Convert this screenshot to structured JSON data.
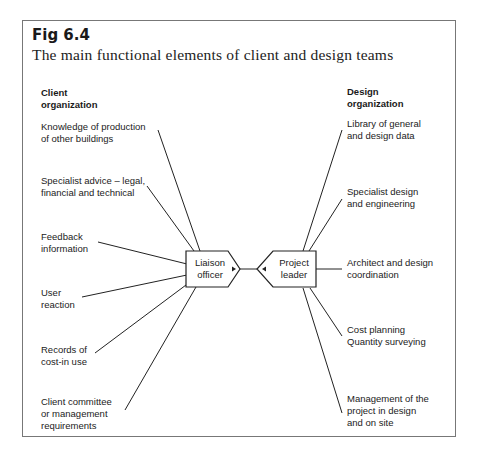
{
  "figure": {
    "label": "Fig 6.4",
    "caption": "The main functional elements of client and design teams"
  },
  "client": {
    "heading_line1": "Client",
    "heading_line2": "organization",
    "hub": {
      "line1": "Liaison",
      "line2": "officer"
    },
    "items": [
      {
        "line1": "Knowledge of production",
        "line2": "of other buildings",
        "line3": ""
      },
      {
        "line1": "Specialist advice – legal,",
        "line2": "financial and technical",
        "line3": ""
      },
      {
        "line1": "Feedback",
        "line2": "information",
        "line3": ""
      },
      {
        "line1": "User",
        "line2": "reaction",
        "line3": ""
      },
      {
        "line1": "Records of",
        "line2": "cost-in use",
        "line3": ""
      },
      {
        "line1": "Client committee",
        "line2": "or management",
        "line3": "requirements"
      }
    ]
  },
  "design": {
    "heading_line1": "Design",
    "heading_line2": "organization",
    "hub": {
      "line1": "Project",
      "line2": "leader"
    },
    "items": [
      {
        "line1": "Library of general",
        "line2": "and design data",
        "line3": ""
      },
      {
        "line1": "Specialist design",
        "line2": "and engineering",
        "line3": ""
      },
      {
        "line1": "Architect and design",
        "line2": "coordination",
        "line3": ""
      },
      {
        "line1": "Cost planning",
        "line2": "Quantity surveying",
        "line3": ""
      },
      {
        "line1": "Management of the",
        "line2": "project in design",
        "line3": "and on site"
      }
    ]
  },
  "colors": {
    "line": "#222222",
    "border": "#777777",
    "text": "#222222"
  }
}
